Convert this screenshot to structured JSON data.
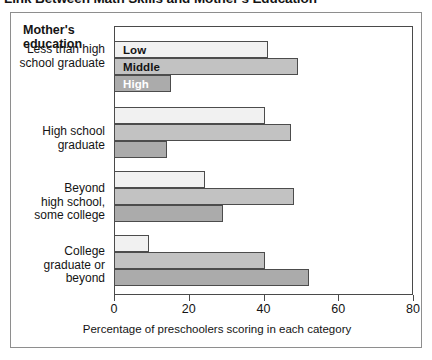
{
  "figure": {
    "title": "Link Between Math Skills and Mother's Education"
  },
  "legend": {
    "title": "Mother's\neducation",
    "title_line1": "Mother's",
    "title_line2": "education",
    "entries": [
      {
        "key": "low",
        "label": "Low",
        "color": "#f1f1f1"
      },
      {
        "key": "middle",
        "label": "Middle",
        "color": "#c2c2c2"
      },
      {
        "key": "high",
        "label": "High",
        "color": "#ababab"
      }
    ]
  },
  "chart_data": {
    "type": "bar",
    "orientation": "horizontal",
    "title": "Link Between Math Skills and Mother's Education",
    "xlabel": "Percentage of preschoolers scoring in each category",
    "ylabel": "",
    "xlim": [
      0,
      80
    ],
    "xticks": [
      0,
      20,
      40,
      60,
      80
    ],
    "xtick_labels": [
      "0",
      "20",
      "40",
      "60",
      "80"
    ],
    "grid": false,
    "legend_position": "inside-top-left",
    "categories": [
      "Less than high school graduate",
      "High school graduate",
      "Beyond high school, some college",
      "College graduate or beyond"
    ],
    "category_lines": [
      [
        "Less than high",
        "school graduate"
      ],
      [
        "High school",
        "graduate"
      ],
      [
        "Beyond",
        "high school,",
        "some college"
      ],
      [
        "College",
        "graduate or",
        "beyond"
      ]
    ],
    "series": [
      {
        "name": "Low",
        "color": "#f1f1f1",
        "values": [
          41,
          40,
          24,
          9
        ]
      },
      {
        "name": "Middle",
        "color": "#c2c2c2",
        "values": [
          49,
          47,
          48,
          40
        ]
      },
      {
        "name": "High",
        "color": "#ababab",
        "values": [
          15,
          14,
          29,
          52
        ]
      }
    ]
  }
}
